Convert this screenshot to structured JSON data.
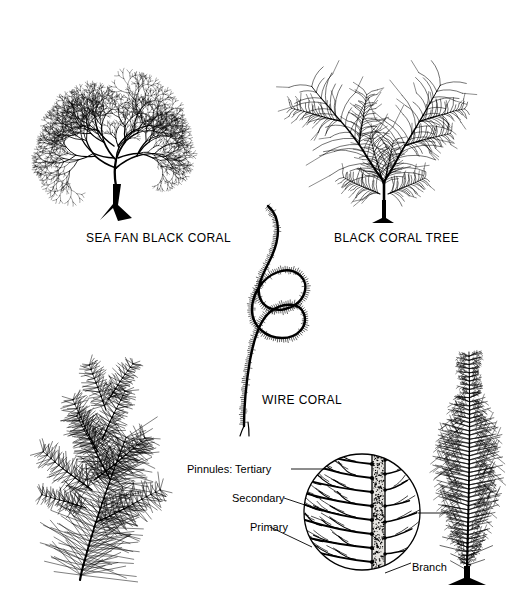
{
  "figure": {
    "title_visible": false,
    "background_color": "#ffffff",
    "ink_color": "#000000",
    "specimens": [
      {
        "id": "sea-fan-black-coral",
        "label": "SEA FAN BLACK CORAL",
        "form": "planar fan, densely dichotomously branched, solid holdfast"
      },
      {
        "id": "black-coral-tree",
        "label": "BLACK CORAL TREE",
        "form": "V-shaped twin plumes, feathery pinnules, solid holdfast"
      },
      {
        "id": "wire-coral",
        "label": "WIRE CORAL",
        "form": "single unbranched coiled stem with two loops, bristled"
      },
      {
        "id": "bottlebrush-coral",
        "label": "",
        "form": "bottlebrush branches with needle pinnules"
      },
      {
        "id": "bushy-coral",
        "label": "",
        "form": "tall narrow bushy colony with solid holdfast"
      }
    ]
  },
  "detail_callout": {
    "shape": "circle",
    "labels": {
      "tertiary": "Pinnules: Tertiary",
      "secondary": "Secondary",
      "primary": "Primary",
      "branch": "Branch"
    }
  },
  "chart_data": {
    "type": "diagram",
    "items": [
      {
        "name": "SEA FAN BLACK CORAL",
        "position": "top-left"
      },
      {
        "name": "BLACK CORAL TREE",
        "position": "top-right"
      },
      {
        "name": "WIRE CORAL",
        "position": "center"
      }
    ],
    "annotations": [
      "Pinnules: Tertiary",
      "Secondary",
      "Primary",
      "Branch"
    ]
  }
}
